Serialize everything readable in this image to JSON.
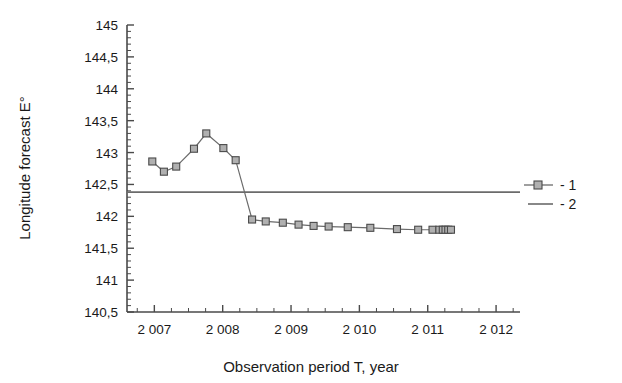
{
  "chart_data": {
    "type": "line",
    "title": "",
    "xlabel": "Observation period T, year",
    "ylabel": "Longitude forecast E°",
    "xlim": [
      2006.6,
      2012.35
    ],
    "ylim": [
      140.5,
      145.0
    ],
    "grid": false,
    "legend_position": "right",
    "decimal_separator": ",",
    "x_tick_labels": [
      "2 007",
      "2 008",
      "2 009",
      "2 010",
      "2 011",
      "2 012"
    ],
    "x_tick_values": [
      2007,
      2008,
      2009,
      2010,
      2011,
      2012
    ],
    "x_minor_ticks_between": 3,
    "y_tick_labels": [
      "140,5",
      "141",
      "141,5",
      "142",
      "142,5",
      "143",
      "143,5",
      "144",
      "144,5",
      "145"
    ],
    "y_tick_values": [
      140.5,
      141,
      141.5,
      142,
      142.5,
      143,
      143.5,
      144,
      144.5,
      145
    ],
    "y_minor_ticks_between": 4,
    "series": [
      {
        "name": "1",
        "legend_label": "- 1",
        "style": "line-with-square-markers",
        "color": "#6b6b6b",
        "marker_fill": "#b0b0b0",
        "x": [
          2006.97,
          2007.14,
          2007.32,
          2007.58,
          2007.76,
          2008.01,
          2008.19,
          2008.43,
          2008.63,
          2008.88,
          2009.11,
          2009.33,
          2009.55,
          2009.83,
          2010.16,
          2010.55,
          2010.86,
          2011.07,
          2011.17,
          2011.22,
          2011.26,
          2011.3,
          2011.34
        ],
        "y": [
          142.86,
          142.7,
          142.78,
          143.06,
          143.3,
          143.07,
          142.88,
          141.95,
          141.92,
          141.9,
          141.87,
          141.85,
          141.84,
          141.83,
          141.82,
          141.8,
          141.79,
          141.79,
          141.79,
          141.79,
          141.79,
          141.79,
          141.79
        ]
      },
      {
        "name": "2",
        "legend_label": "- 2",
        "style": "horizontal-line",
        "color": "#6b6b6b",
        "constant_value": 142.38
      }
    ]
  },
  "legend": {
    "entries": [
      {
        "label": "- 1",
        "marker": "square-marker-line"
      },
      {
        "label": "- 2",
        "marker": "plain-line"
      }
    ]
  }
}
